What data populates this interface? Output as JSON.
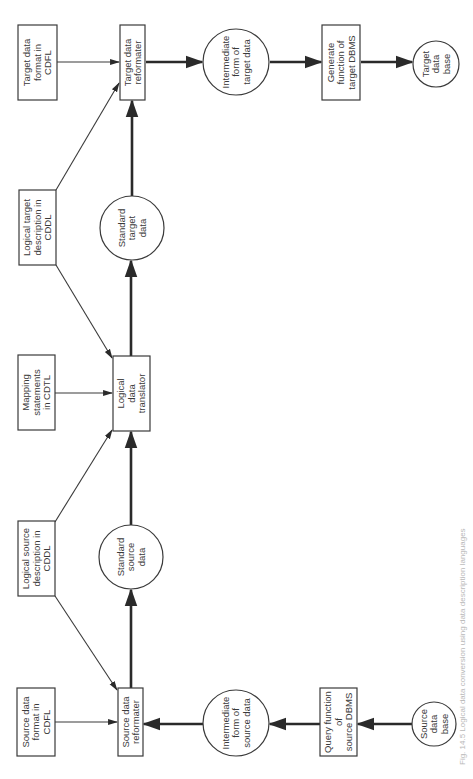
{
  "diagram": {
    "caption": "Fig. 14.5 Logical data conversion using data description languages",
    "nodes": {
      "source_format": {
        "shape": "box",
        "lines": [
          "Source data",
          "format in",
          "CDFL"
        ]
      },
      "logical_source": {
        "shape": "box",
        "lines": [
          "Logical source",
          "description in",
          "CDDL"
        ]
      },
      "mapping": {
        "shape": "box",
        "lines": [
          "Mapping",
          "statements",
          "in CDTL"
        ]
      },
      "logical_target": {
        "shape": "box",
        "lines": [
          "Logical target",
          "description in",
          "CDDL"
        ]
      },
      "target_format": {
        "shape": "box",
        "lines": [
          "Target data",
          "format in",
          "CDFL"
        ]
      },
      "source_reformatter": {
        "shape": "box",
        "lines": [
          "Source data",
          "reformater"
        ]
      },
      "standard_source": {
        "shape": "circle",
        "lines": [
          "Standard",
          "source",
          "data"
        ]
      },
      "translator": {
        "shape": "box",
        "lines": [
          "Logical",
          "data",
          "translator"
        ]
      },
      "standard_target": {
        "shape": "circle",
        "lines": [
          "Standard",
          "target",
          "data"
        ]
      },
      "target_reformatter": {
        "shape": "box",
        "lines": [
          "Target data",
          "reformater"
        ]
      },
      "intermediate_source": {
        "shape": "circle",
        "lines": [
          "Intermediate",
          "form of",
          "source data"
        ]
      },
      "intermediate_target": {
        "shape": "circle",
        "lines": [
          "Intermediate",
          "form of",
          "target data"
        ]
      },
      "query_function": {
        "shape": "box",
        "lines": [
          "Query function",
          "of",
          "source DBMS"
        ]
      },
      "generate_function": {
        "shape": "box",
        "lines": [
          "Generate",
          "function of",
          "target DBMS"
        ]
      },
      "source_db": {
        "shape": "circle",
        "lines": [
          "Source",
          "data",
          "base"
        ]
      },
      "target_db": {
        "shape": "circle",
        "lines": [
          "Target",
          "data",
          "base"
        ]
      }
    },
    "edges": [
      {
        "from": "source_db",
        "to": "query_function",
        "weight": "thick"
      },
      {
        "from": "query_function",
        "to": "intermediate_source",
        "weight": "thick"
      },
      {
        "from": "intermediate_source",
        "to": "source_reformatter",
        "weight": "thick"
      },
      {
        "from": "source_format",
        "to": "source_reformatter",
        "weight": "thin"
      },
      {
        "from": "logical_source",
        "to": "source_reformatter",
        "weight": "thin"
      },
      {
        "from": "source_reformatter",
        "to": "standard_source",
        "weight": "thick"
      },
      {
        "from": "standard_source",
        "to": "translator",
        "weight": "thick"
      },
      {
        "from": "logical_source",
        "to": "translator",
        "weight": "thin"
      },
      {
        "from": "mapping",
        "to": "translator",
        "weight": "thin"
      },
      {
        "from": "logical_target",
        "to": "translator",
        "weight": "thin"
      },
      {
        "from": "translator",
        "to": "standard_target",
        "weight": "thick"
      },
      {
        "from": "standard_target",
        "to": "target_reformatter",
        "weight": "thick"
      },
      {
        "from": "logical_target",
        "to": "target_reformatter",
        "weight": "thin"
      },
      {
        "from": "target_format",
        "to": "target_reformatter",
        "weight": "thin"
      },
      {
        "from": "target_reformatter",
        "to": "intermediate_target",
        "weight": "thick"
      },
      {
        "from": "intermediate_target",
        "to": "generate_function",
        "weight": "thick"
      },
      {
        "from": "generate_function",
        "to": "target_db",
        "weight": "thick"
      }
    ]
  }
}
